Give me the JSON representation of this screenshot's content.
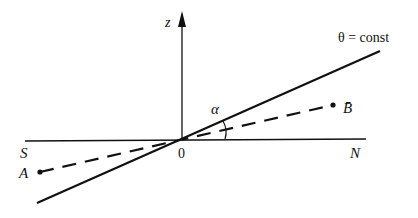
{
  "diagram": {
    "axis_labels": {
      "z": "z",
      "south": "S",
      "north": "N",
      "origin": "0"
    },
    "line_label": "θ = const",
    "angle_label": "α",
    "points": {
      "A": "A",
      "B": "B̄"
    },
    "colors": {
      "ink": "#111111",
      "background": "#ffffff"
    }
  }
}
